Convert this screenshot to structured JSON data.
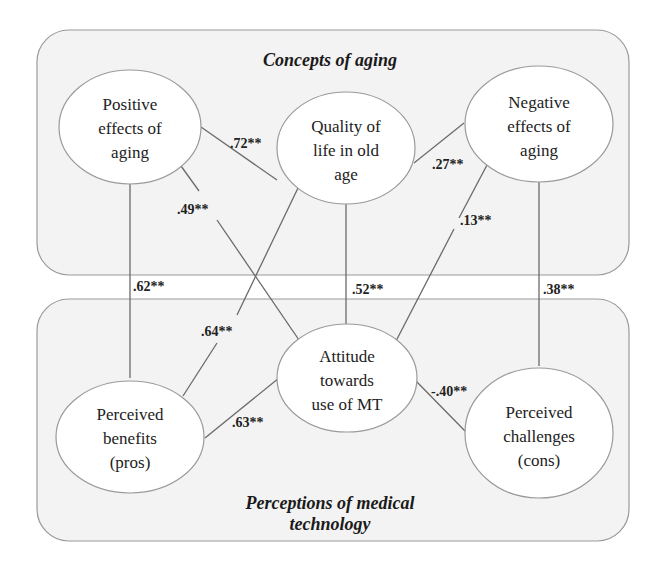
{
  "groups": {
    "concepts": {
      "title": "Concepts of aging"
    },
    "perceptions": {
      "title_lines": [
        "Perceptions of medical",
        "technology"
      ]
    }
  },
  "nodes": {
    "positive": {
      "lines": [
        "Positive",
        "effects of",
        "aging"
      ]
    },
    "quality": {
      "lines": [
        "Quality of",
        "life in old",
        "age"
      ]
    },
    "negative": {
      "lines": [
        "Negative",
        "effects of",
        "aging"
      ]
    },
    "attitude": {
      "lines": [
        "Attitude",
        "towards",
        "use of MT"
      ]
    },
    "benefits": {
      "lines": [
        "Perceived",
        "benefits",
        "(pros)"
      ]
    },
    "challenges": {
      "lines": [
        "Perceived",
        "challenges",
        "(cons)"
      ]
    }
  },
  "edges": [
    {
      "from": "positive",
      "to": "quality",
      "coefficient": ".72**"
    },
    {
      "from": "positive",
      "to": "attitude",
      "coefficient": ".49**"
    },
    {
      "from": "positive",
      "to": "benefits",
      "coefficient": ".62**"
    },
    {
      "from": "quality",
      "to": "negative",
      "coefficient": ".27**"
    },
    {
      "from": "negative",
      "to": "attitude",
      "coefficient": ".13**"
    },
    {
      "from": "quality",
      "to": "attitude",
      "coefficient": ".52**"
    },
    {
      "from": "quality",
      "to": "benefits",
      "coefficient": ".64**"
    },
    {
      "from": "negative",
      "to": "challenges",
      "coefficient": ".38**"
    },
    {
      "from": "attitude",
      "to": "benefits",
      "coefficient": ".63**"
    },
    {
      "from": "attitude",
      "to": "challenges",
      "coefficient": "-.40**"
    }
  ]
}
